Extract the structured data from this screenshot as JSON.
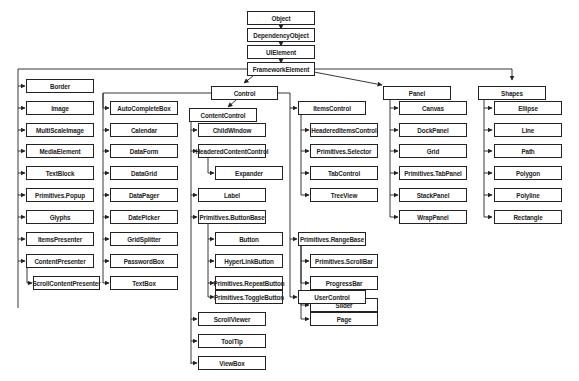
{
  "colors": {
    "line": "#222222",
    "box_border": "#222222",
    "box_fill": "#ffffff",
    "text": "#222222"
  },
  "root_chain": [
    "Object",
    "DependencyObject",
    "UIElement",
    "FrameworkElement"
  ],
  "framework_children": {
    "direct": [
      "Border",
      "Image",
      "MultiScaleImage",
      "MediaElement",
      "TextBlock",
      "Primitives.Popup",
      "Glyphs",
      "ItemsPresenter",
      "ContentPresenter"
    ],
    "content_presenter_children": [
      "ScrollContentPresenter"
    ]
  },
  "control": {
    "label": "Control",
    "direct": [
      "AutoCompleteBox",
      "Calendar",
      "DataForm",
      "DataGrid",
      "DataPager",
      "DatePicker",
      "GridSplitter",
      "PasswordBox",
      "TextBox"
    ],
    "content_control": {
      "label": "ContentControl",
      "children": [
        "ChildWindow",
        "HeaderedContentControl",
        "Label",
        "Primitives.ButtonBase",
        "ScrollViewer",
        "ToolTip",
        "ViewBox"
      ],
      "headered_content_control_children": [
        "Expander"
      ],
      "button_base_children": [
        "Button",
        "HyperLinkButton",
        "Primitives.RepeatButton",
        "Primitives.ToggleButton"
      ]
    },
    "items_control": {
      "label": "ItemsControl",
      "children": [
        "HeaderedItemsControl",
        "Primitives.Selector",
        "TabControl",
        "TreeView"
      ]
    },
    "range_base": {
      "label": "Primitives.RangeBase",
      "children": [
        "Primitives.ScrollBar",
        "ProgressBar",
        "Slider"
      ]
    },
    "user_control": {
      "label": "UserControl",
      "children": [
        "Page"
      ]
    }
  },
  "panel": {
    "label": "Panel",
    "children": [
      "Canvas",
      "DockPanel",
      "Grid",
      "Primitives.TabPanel",
      "StackPanel",
      "WrapPanel"
    ]
  },
  "shapes": {
    "label": "Shapes",
    "children": [
      "Ellipse",
      "Line",
      "Path",
      "Polygon",
      "Polyline",
      "Rectangle"
    ]
  }
}
